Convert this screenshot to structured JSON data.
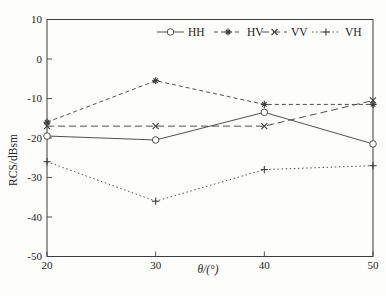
{
  "figure": {
    "background": "#fdfdfb",
    "line_color": "#3d3d3d",
    "text_color": "#222222"
  },
  "chart_data": {
    "type": "line",
    "title": "",
    "xlabel": "θ/(°)",
    "ylabel": "RCS/dBsm",
    "x": [
      20,
      30,
      40,
      50
    ],
    "xlim": [
      20,
      50
    ],
    "ylim": [
      -50,
      10
    ],
    "xticks": [
      20,
      30,
      40,
      50
    ],
    "yticks": [
      10,
      0,
      -10,
      -20,
      -30,
      -40,
      -50
    ],
    "grid": false,
    "legend_position": "top-right-inside",
    "legend_border": false,
    "series": [
      {
        "name": "HH",
        "values": [
          -19.5,
          -20.5,
          -13.5,
          -21.5
        ],
        "line_style": "solid",
        "marker": "open-circle"
      },
      {
        "name": "HV",
        "values": [
          -16.0,
          -5.5,
          -11.5,
          -11.5
        ],
        "line_style": "dashed",
        "marker": "asterisk"
      },
      {
        "name": "VV",
        "values": [
          -17.0,
          -17.0,
          -17.0,
          -10.5
        ],
        "line_style": "long-dashed",
        "marker": "x"
      },
      {
        "name": "VH",
        "values": [
          -26.0,
          -36.0,
          -28.0,
          -27.0
        ],
        "line_style": "dotted",
        "marker": "plus"
      }
    ]
  }
}
